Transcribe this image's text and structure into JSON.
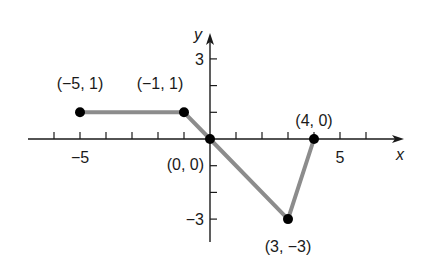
{
  "chart_data": {
    "type": "line",
    "title": "",
    "xlabel": "x",
    "ylabel": "y",
    "xlim": [
      -7,
      7
    ],
    "ylim": [
      -4,
      4
    ],
    "grid": false,
    "x_tick_labels": [
      {
        "value": -5,
        "label": "−5"
      },
      {
        "value": 5,
        "label": "5"
      }
    ],
    "y_tick_labels": [
      {
        "value": 3,
        "label": "3"
      },
      {
        "value": -3,
        "label": "−3"
      }
    ],
    "x_ticks": [
      -6,
      -5,
      -4,
      -3,
      -2,
      -1,
      1,
      2,
      3,
      4,
      5,
      6
    ],
    "y_ticks": [
      3,
      2,
      1,
      -1,
      -2,
      -3
    ],
    "series": [
      {
        "name": "piecewise",
        "points": [
          {
            "x": -5,
            "y": 1,
            "label": "(−5, 1)"
          },
          {
            "x": -1,
            "y": 1,
            "label": "(−1, 1)"
          },
          {
            "x": 0,
            "y": 0,
            "label": "(0, 0)"
          },
          {
            "x": 3,
            "y": -3,
            "label": "(3, −3)"
          },
          {
            "x": 4,
            "y": 0,
            "label": "(4, 0)"
          }
        ],
        "color": "#8c8c8c"
      }
    ]
  }
}
